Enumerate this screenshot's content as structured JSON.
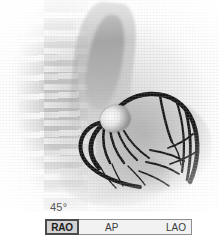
{
  "viewer": {
    "modality_label": "coronary-angiography",
    "image_area_name": "fluoroscopy-image"
  },
  "anatomy": [
    {
      "name": "vertebral-column"
    },
    {
      "name": "mediastinum-aortic-shadow"
    },
    {
      "name": "cardiac-silhouette"
    },
    {
      "name": "diaphragm"
    },
    {
      "name": "catheter-tip-ostium"
    },
    {
      "name": "coronary-artery-tree"
    }
  ],
  "controls": {
    "angle_value": "45°",
    "slider_name": "projection-angle-slider",
    "positions": [
      {
        "key": "rao",
        "label": "RAO",
        "selected": true
      },
      {
        "key": "ap",
        "label": "AP",
        "selected": false
      },
      {
        "key": "lao",
        "label": "LAO",
        "selected": false
      }
    ],
    "rao_label": "RAO",
    "ap_label": "AP",
    "lao_label": "LAO"
  },
  "colors": {
    "background": "#ffffff",
    "vessel": "#161616",
    "slider_border": "#8e8e8e",
    "slider_track": "#f2f2f2",
    "handle_fill": "#d2d2d2",
    "handle_border": "#4a4a4a",
    "text": "#3a3a3a"
  }
}
